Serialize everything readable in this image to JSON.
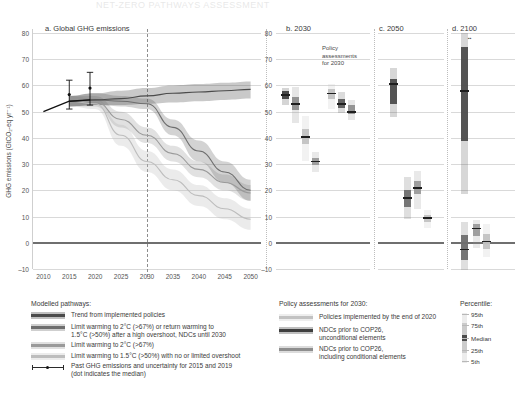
{
  "figure": {
    "faded_header": "NET-ZERO PATHWAYS  ASSESSMENT"
  },
  "panels": {
    "a": {
      "title": "a. Global GHG emissions",
      "ylabel": "GHG emissions (GtCO₂-eq yr⁻¹)",
      "yticks": [
        "80",
        "70",
        "60",
        "50",
        "40",
        "30",
        "20",
        "10",
        "0",
        "–10"
      ],
      "xticks": [
        "2010",
        "2015",
        "2020",
        "2025",
        "2030",
        "2035",
        "2040",
        "2045",
        "2050"
      ],
      "marker_year": "2030"
    },
    "b": {
      "title": "b. 2030",
      "annotation": "Policy\nassessments\nfor 2030",
      "yticks": [
        "80",
        "70",
        "60",
        "50",
        "40",
        "30",
        "20",
        "10",
        "0",
        "–10"
      ]
    },
    "c": {
      "title": "c. 2050"
    },
    "d": {
      "title": "d. 2100",
      "off_scale_marker": "▪▪"
    }
  },
  "legend_left": {
    "title": "Modelled pathways:",
    "items": [
      {
        "label": "Trend from implemented policies",
        "color": "#4b4b4b",
        "halo": "#8c8c8c"
      },
      {
        "label": "Limit warming to 2°C (>67%) or return warming to\n1.5°C (>50%) after a high overshoot, NDCs until 2030",
        "color": "#6e6e6e",
        "halo": "#a8a8a8"
      },
      {
        "label": "Limit warming to 2°C (>67%)",
        "color": "#9a9a9a",
        "halo": "#c6c6c6"
      },
      {
        "label": "Limit warming to 1.5°C (>50%) with no or limited overshoot",
        "color": "#bdbdbd",
        "halo": "#dcdcdc"
      }
    ],
    "past_label": "Past GHG emissions and uncertainty for 2015 and 2019\n(dot indicates the median)"
  },
  "legend_right": {
    "title": "Policy assessments for 2030:",
    "items": [
      {
        "label": "Policies implemented by the end of 2020",
        "color": "#c2c2c2",
        "halo": "#e0e0e0"
      },
      {
        "label": "NDCs prior to COP26,\nunconditional elements",
        "color": "#3f3f3f",
        "halo": "#8a8a8a"
      },
      {
        "label": "NDCs prior to COP26,\nincluding conditional elements",
        "color": "#8e8e8e",
        "halo": "#c0c0c0"
      }
    ]
  },
  "legend_percentile": {
    "title": "Percentile:",
    "ticks": [
      "95th",
      "75th",
      "Median",
      "25th",
      "5th"
    ]
  },
  "chart_data": {
    "type": "line",
    "xlabel": "",
    "ylabel": "GHG emissions (GtCO2-eq yr-1)",
    "ylim": [
      -10,
      80
    ],
    "xlim": [
      2008,
      2052
    ],
    "grid": true,
    "panel_a": {
      "type": "area",
      "x": [
        2015,
        2020,
        2025,
        2030,
        2035,
        2040,
        2045,
        2050
      ],
      "series": [
        {
          "name": "Trend from implemented policies",
          "color": "#4b4b4b",
          "median": [
            54,
            54.5,
            55,
            56,
            57,
            57.5,
            58,
            58.5
          ],
          "low": [
            52,
            52.5,
            52.5,
            53,
            53.5,
            54,
            54.5,
            55
          ],
          "high": [
            56,
            57,
            58,
            59,
            60,
            60.5,
            61,
            61.5
          ]
        },
        {
          "name": "Limit warming to 2C (>67%) or return warming to 1.5C (>50%) after a high overshoot, NDCs until 2030",
          "color": "#6e6e6e",
          "median": [
            54,
            54.5,
            54,
            53,
            44,
            35,
            27,
            20
          ],
          "low": [
            52,
            52.5,
            52,
            51,
            41,
            31,
            23,
            16
          ],
          "high": [
            56,
            57,
            56,
            55,
            47,
            39,
            31,
            24
          ]
        },
        {
          "name": "Limit warming to 2C (>67%)",
          "color": "#9a9a9a",
          "median": [
            54,
            54,
            47,
            41,
            34,
            28,
            23,
            19
          ],
          "low": [
            52,
            52,
            44,
            38,
            31,
            25,
            20,
            16
          ],
          "high": [
            56,
            56,
            50,
            44,
            37,
            31,
            26,
            22
          ]
        },
        {
          "name": "Limit warming to 1.5C (>50%) with no or limited overshoot",
          "color": "#bdbdbd",
          "median": [
            54,
            53,
            41,
            31,
            24,
            18,
            13,
            9
          ],
          "low": [
            52,
            51,
            37,
            27,
            20,
            14,
            9,
            5
          ],
          "high": [
            56,
            55,
            45,
            35,
            28,
            22,
            17,
            13
          ]
        }
      ],
      "historical": {
        "x": [
          2010,
          2015,
          2019
        ],
        "y": [
          50,
          54,
          54.5
        ]
      },
      "uncertainty_points": [
        {
          "year": 2015,
          "median": 56.5,
          "low": 51,
          "high": 62
        },
        {
          "year": 2019,
          "median": 59,
          "low": 52.5,
          "high": 65
        }
      ]
    },
    "panel_b": {
      "type": "box",
      "year": 2030,
      "boxes": [
        {
          "group": "policy",
          "name": "Policies implemented by the end of 2020",
          "color": "#3f3f3f",
          "p5": 52.5,
          "p25": 55,
          "median": 56.5,
          "p75": 58,
          "p95": 59
        },
        {
          "group": "policy",
          "name": "NDCs prior to COP26, unconditional elements",
          "color": "#8e8e8e",
          "p5": 45.5,
          "p25": 50.5,
          "median": 53,
          "p75": 55.5,
          "p95": 59.5
        },
        {
          "group": "policy",
          "name": "NDCs prior to COP26, including conditional elements",
          "color": "#c2c2c2",
          "p5": 31,
          "p25": 37.5,
          "median": 40.5,
          "p75": 43.5,
          "p95": 48.5
        },
        {
          "group": "policy",
          "name": "NDCs prior to COP26, conditional",
          "color": "#9a9a9a",
          "p5": 27,
          "p25": 29.5,
          "median": 31,
          "p75": 32.5,
          "p95": 34.5
        },
        {
          "group": "pathway",
          "name": "Trend from implemented policies",
          "color": "#c2c2c2",
          "p5": 51,
          "p25": 55,
          "median": 57,
          "p75": 58.5,
          "p95": 60.5
        },
        {
          "group": "pathway",
          "name": "Limit warming to 2C (>67%) or high overshoot, NDCs until 2030",
          "color": "#5a5a5a",
          "p5": 49.5,
          "p25": 51.5,
          "median": 53,
          "p75": 55,
          "p95": 57.5
        },
        {
          "group": "pathway",
          "name": "Limit warming to 2C (>67%)",
          "color": "#8e8e8e",
          "p5": 47,
          "p25": 49,
          "median": 50,
          "p75": 52.5,
          "p95": 54.5
        }
      ]
    },
    "panel_c": {
      "type": "box",
      "year": 2050,
      "boxes": [
        {
          "name": "Trend from implemented policies",
          "color": "#4b4b4b",
          "p5": 48,
          "p25": 53,
          "median": 60.5,
          "p75": 62.5,
          "p95": 66.5
        },
        {
          "name": "Limit warming to 2C (>67%) or high overshoot, NDCs until 2030",
          "color": "#6e6e6e",
          "p5": 9,
          "p25": 13.5,
          "median": 17,
          "p75": 20,
          "p95": 25
        },
        {
          "name": "Limit warming to 2C (>67%)",
          "color": "#9a9a9a",
          "p5": 13,
          "p25": 18.5,
          "median": 21,
          "p75": 23.5,
          "p95": 27.5
        },
        {
          "name": "Limit warming to 1.5C (>50%) with no or limited overshoot",
          "color": "#c2c2c2",
          "p5": 5.5,
          "p25": 8,
          "median": 9.5,
          "p75": 10.5,
          "p95": 12.5
        }
      ]
    },
    "panel_d": {
      "type": "box",
      "year": 2100,
      "off_scale": true,
      "boxes": [
        {
          "name": "Trend from implemented policies",
          "color": "#4b4b4b",
          "p5": 18.5,
          "p25": 39,
          "median": 58,
          "p75": 74.5,
          "p95": 80
        },
        {
          "name": "Limit warming to 2C (>67%) or high overshoot, NDCs until 2030",
          "color": "#6e6e6e",
          "p5": -10.5,
          "p25": -6.5,
          "median": -2.5,
          "p75": 3,
          "p95": 8
        },
        {
          "name": "Limit warming to 2C (>67%)",
          "color": "#9a9a9a",
          "p5": -2,
          "p25": 2.5,
          "median": 5.5,
          "p75": 7,
          "p95": 8.5
        },
        {
          "name": "Limit warming to 1.5C (>50%) with no or limited overshoot",
          "color": "#c2c2c2",
          "p5": -5.5,
          "p25": -2.5,
          "median": 0.5,
          "p75": 3.5,
          "p95": 7
        }
      ]
    }
  }
}
